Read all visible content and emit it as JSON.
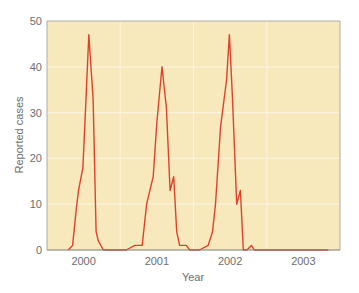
{
  "chart_data": {
    "type": "line",
    "title": "",
    "xlabel": "Year",
    "ylabel": "Reported cases",
    "ylim": [
      0,
      50
    ],
    "xlim": [
      1999.5,
      2003.5
    ],
    "yticks": [
      0,
      10,
      20,
      30,
      40,
      50
    ],
    "xticks": [
      {
        "label": "2000",
        "x": 2000.0
      },
      {
        "label": "2001",
        "x": 2001.0
      },
      {
        "label": "2002",
        "x": 2002.0
      },
      {
        "label": "2003",
        "x": 2003.0
      }
    ],
    "grid": true,
    "legend": null,
    "colors": {
      "plot_background": "#f8e9bd",
      "gridline": "#fbf3dc",
      "axis": "#7a7a7a",
      "line": "#e0412a"
    },
    "series": [
      {
        "name": "Reported cases",
        "x": [
          1999.79,
          1999.85,
          1999.9,
          1999.93,
          1999.99,
          2000.03,
          2000.07,
          2000.13,
          2000.17,
          2000.2,
          2000.27,
          2000.36,
          2000.58,
          2000.7,
          2000.8,
          2000.86,
          2000.95,
          2001.0,
          2001.07,
          2001.13,
          2001.18,
          2001.23,
          2001.27,
          2001.31,
          2001.4,
          2001.45,
          2001.5,
          2001.58,
          2001.7,
          2001.76,
          2001.8,
          2001.87,
          2001.95,
          2001.99,
          2002.03,
          2002.09,
          2002.14,
          2002.18,
          2002.23,
          2002.29,
          2002.33,
          2002.38,
          2002.44,
          2002.48,
          2002.51,
          2002.58,
          2002.7,
          2002.75,
          2002.8,
          2002.86,
          2002.92,
          2002.95,
          2003.0,
          2003.04,
          2003.09,
          2003.16,
          2003.2,
          2003.28,
          2003.34
        ],
        "values": [
          0,
          1,
          9,
          13,
          18,
          32,
          47,
          33,
          4,
          2,
          0,
          0,
          0,
          1,
          1,
          10,
          16,
          28,
          40,
          31,
          13,
          16,
          4,
          1,
          1,
          0,
          0,
          0,
          1,
          4,
          10,
          27,
          37,
          47,
          34,
          10,
          13,
          0,
          0,
          1,
          0,
          0,
          0,
          0,
          0,
          0,
          0,
          0,
          0,
          0,
          0,
          0,
          0,
          0,
          0,
          0,
          0,
          0,
          0
        ]
      }
    ]
  }
}
